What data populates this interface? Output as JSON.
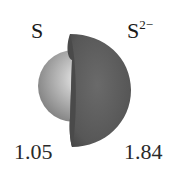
{
  "diagram": {
    "atom": {
      "symbol": "S",
      "radius_label": "1.05",
      "color": "#b0b0b0"
    },
    "ion": {
      "symbol": "S",
      "charge": "2−",
      "radius_label": "1.84",
      "color": "#5a5a5a"
    }
  }
}
